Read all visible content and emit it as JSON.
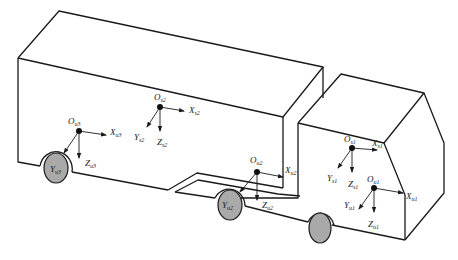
{
  "figure": {
    "colors": {
      "line": "#1a1a1a",
      "wheel_fill": "#a9a9a9",
      "background": "#ffffff"
    }
  },
  "frames": {
    "s1": {
      "origin": {
        "main": "O",
        "sub": "s1"
      },
      "x": {
        "main": "X",
        "sub": "s1"
      },
      "y": {
        "main": "Y",
        "sub": "s1"
      },
      "z": {
        "main": "Z",
        "sub": "s1"
      }
    },
    "s2": {
      "origin": {
        "main": "O",
        "sub": "s2"
      },
      "x": {
        "main": "X",
        "sub": "s2"
      },
      "y": {
        "main": "Y",
        "sub": "s2"
      },
      "z": {
        "main": "Z",
        "sub": "s2"
      }
    },
    "u1": {
      "origin": {
        "main": "O",
        "sub": "u1"
      },
      "x": {
        "main": "X",
        "sub": "u1"
      },
      "y": {
        "main": "Y",
        "sub": "u1"
      },
      "z": {
        "main": "Z",
        "sub": "u1"
      }
    },
    "u2": {
      "origin": {
        "main": "O",
        "sub": "u2"
      },
      "x": {
        "main": "X",
        "sub": "u2"
      },
      "y": {
        "main": "Y",
        "sub": "u2"
      },
      "z": {
        "main": "Z",
        "sub": "u2"
      }
    },
    "u3": {
      "origin": {
        "main": "O",
        "sub": "u3"
      },
      "x": {
        "main": "X",
        "sub": "u3"
      },
      "y": {
        "main": "Y",
        "sub": "u3"
      },
      "z": {
        "main": "Z",
        "sub": "u3"
      }
    }
  }
}
